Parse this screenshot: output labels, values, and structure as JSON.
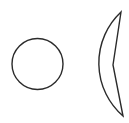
{
  "diagram": {
    "background": "#ffffff",
    "stroke_color": "#2b2b2b",
    "stroke_width": 1.4,
    "shapes": [
      {
        "type": "circle",
        "name": "circle",
        "cx": 37.5,
        "cy": 64,
        "r": 25.5
      },
      {
        "type": "sector-with-notch",
        "name": "notched-sector",
        "arc_start": [
          121,
          12
        ],
        "arc_leftmost": [
          63,
          64
        ],
        "arc_end": [
          123,
          116
        ],
        "arc_radius": 70,
        "notch_vertex": [
          113,
          65
        ]
      }
    ]
  }
}
